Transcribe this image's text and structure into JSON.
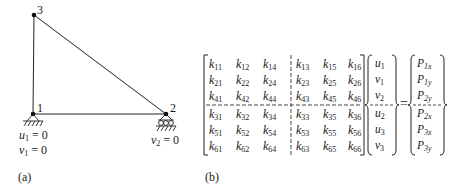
{
  "figure": {
    "panel_a": {
      "label": "(a)",
      "nodes": [
        {
          "id": "1",
          "label": "1",
          "x": 33,
          "y": 114
        },
        {
          "id": "2",
          "label": "2",
          "x": 166,
          "y": 114
        },
        {
          "id": "3",
          "label": "3",
          "x": 34,
          "y": 15
        }
      ],
      "members": [
        [
          "1",
          "2"
        ],
        [
          "1",
          "3"
        ],
        [
          "2",
          "3"
        ]
      ],
      "supports": [
        {
          "node": "1",
          "type": "pin"
        },
        {
          "node": "2",
          "type": "roller"
        }
      ],
      "constraints": {
        "node1_u": {
          "var": "u",
          "sub": "1",
          "rhs": " = 0"
        },
        "node1_v": {
          "var": "v",
          "sub": "1",
          "rhs": " = 0"
        },
        "node2_v": {
          "var": "v",
          "sub": "2",
          "rhs": " = 0"
        }
      }
    },
    "panel_b": {
      "label": "(b)",
      "equals": "=",
      "stiffness_matrix": [
        [
          "11",
          "12",
          "14",
          "13",
          "15",
          "16"
        ],
        [
          "21",
          "22",
          "24",
          "23",
          "25",
          "26"
        ],
        [
          "41",
          "42",
          "44",
          "43",
          "45",
          "46"
        ],
        [
          "31",
          "32",
          "34",
          "33",
          "35",
          "36"
        ],
        [
          "51",
          "52",
          "54",
          "53",
          "55",
          "56"
        ],
        [
          "61",
          "62",
          "64",
          "63",
          "65",
          "66"
        ]
      ],
      "matrix_symbol": "k",
      "displacement_vector": [
        {
          "var": "u",
          "sub": "1"
        },
        {
          "var": "v",
          "sub": "1"
        },
        {
          "var": "v",
          "sub": "2"
        },
        {
          "var": "u",
          "sub": "2"
        },
        {
          "var": "u",
          "sub": "3"
        },
        {
          "var": "v",
          "sub": "3"
        }
      ],
      "force_vector": [
        {
          "var": "P",
          "sub": "1x"
        },
        {
          "var": "P",
          "sub": "1y"
        },
        {
          "var": "P",
          "sub": "2y"
        },
        {
          "var": "P",
          "sub": "2x"
        },
        {
          "var": "P",
          "sub": "3x"
        },
        {
          "var": "P",
          "sub": "3y"
        }
      ]
    }
  }
}
